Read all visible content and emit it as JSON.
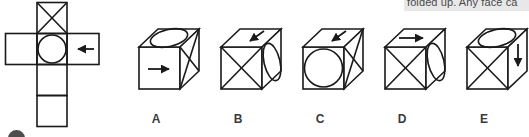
{
  "tooltip": {
    "text": "folded up. Any face ca"
  },
  "net": {
    "name": "cube-net",
    "cells": [
      {
        "id": "top",
        "symbol": "x-cross"
      },
      {
        "id": "left",
        "symbol": "blank"
      },
      {
        "id": "center",
        "symbol": "circle"
      },
      {
        "id": "right",
        "symbol": "arrow-left"
      },
      {
        "id": "below-center",
        "symbol": "blank"
      },
      {
        "id": "bottom",
        "symbol": "blank"
      }
    ]
  },
  "options": [
    {
      "label": "A",
      "top_face": "ellipse",
      "front_face": "arrow-right",
      "side_face": "x-cross"
    },
    {
      "label": "B",
      "top_face": "arrow-down-left",
      "front_face": "x-cross",
      "side_face": "ellipse"
    },
    {
      "label": "C",
      "top_face": "arrow-down-left",
      "front_face": "circle",
      "side_face": "x-cross"
    },
    {
      "label": "D",
      "top_face": "arrow-right",
      "front_face": "x-cross",
      "side_face": "ellipse"
    },
    {
      "label": "E",
      "top_face": "ellipse",
      "front_face": "x-cross",
      "side_face": "arrow-down"
    }
  ],
  "colors": {
    "line": "#1a1a1a",
    "background": "#ffffff",
    "tooltip_bg": "#e8e8e8",
    "tooltip_text": "#4a4a4a",
    "label_text": "#3a3a3a",
    "dot": "#4d4d4d"
  }
}
